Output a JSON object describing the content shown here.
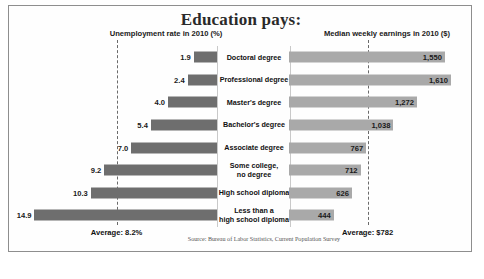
{
  "title": "Education pays:",
  "headers": {
    "left": "Unemployment rate in 2010 (%)",
    "right": "Median weekly earnings in 2010 ($)"
  },
  "averages": {
    "unemployment_label": "Average: 8.2%",
    "earnings_label": "Average: $782",
    "unemployment_value": 8.2,
    "earnings_value": 782
  },
  "source": "Source: Bureau of Labor Statistics, Current Population Survey",
  "colors": {
    "unemployment_bar": "#6e6e6e",
    "earnings_bar": "#a9a9a9",
    "frame": "#8e8e8e",
    "dashed_line": "#6a6a6a"
  },
  "chart_data": {
    "type": "bar",
    "title": "Education pays:",
    "orientation": "horizontal-diverging",
    "categories": [
      "Doctoral degree",
      "Professional degree",
      "Master's degree",
      "Bachelor's degree",
      "Associate degree",
      "Some college, no degree",
      "High school diploma",
      "Less than a high school diploma"
    ],
    "category_lines": [
      [
        "Doctoral degree"
      ],
      [
        "Professional degree"
      ],
      [
        "Master's degree"
      ],
      [
        "Bachelor's degree"
      ],
      [
        "Associate degree"
      ],
      [
        "Some college,",
        "no degree"
      ],
      [
        "High school diploma"
      ],
      [
        "Less than a",
        "high school diploma"
      ]
    ],
    "series": [
      {
        "name": "Unemployment rate in 2010 (%)",
        "side": "left",
        "unit": "%",
        "values": [
          1.9,
          2.4,
          4.0,
          5.4,
          7.0,
          9.2,
          10.3,
          14.9
        ],
        "labels": [
          "1.9",
          "2.4",
          "4.0",
          "5.4",
          "7.0",
          "9.2",
          "10.3",
          "14.9"
        ],
        "average": 8.2,
        "axis_max": 16.0
      },
      {
        "name": "Median weekly earnings in 2010 ($)",
        "side": "right",
        "unit": "$",
        "values": [
          1550,
          1610,
          1272,
          1038,
          767,
          712,
          626,
          444
        ],
        "labels": [
          "1,550",
          "1,610",
          "1,272",
          "1,038",
          "767",
          "712",
          "626",
          "444"
        ],
        "average": 782,
        "axis_max": 1750
      }
    ],
    "grid": false,
    "legend": "none",
    "annotations": [
      "Average: 8.2%",
      "Average: $782"
    ]
  }
}
